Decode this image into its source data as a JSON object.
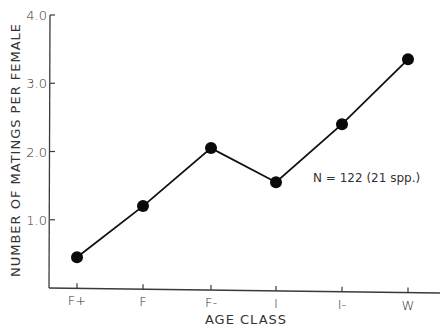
{
  "chart_data": {
    "type": "line",
    "title": "",
    "xlabel": "AGE CLASS",
    "ylabel": "NUMBER OF MATINGS PER FEMALE",
    "categories": [
      "F+",
      "F",
      "F-",
      "I",
      "I-",
      "W"
    ],
    "x_tick_labels": [
      "F+",
      "F",
      "F-",
      "I",
      "I-",
      "W"
    ],
    "series": [
      {
        "name": "Matings per female",
        "values": [
          0.45,
          1.2,
          2.05,
          1.55,
          2.4,
          3.35
        ],
        "marker": "filled-circle",
        "color": "#111111"
      }
    ],
    "ylim": [
      0,
      4.0
    ],
    "y_ticks": [
      1.0,
      2.0,
      3.0,
      4.0
    ],
    "y_tick_labels": [
      "1.0",
      "2.0",
      "3.0",
      "4.0"
    ],
    "grid": false,
    "legend": null,
    "annotations": [
      {
        "text": "N = 122 (21 spp.)",
        "x_category": "I",
        "y_value": 1.65
      }
    ]
  },
  "labels": {
    "xlabel": "AGE CLASS",
    "ylabel": "NUMBER OF MATINGS PER FEMALE",
    "annotation": "N = 122 (21 spp.)"
  },
  "colors": {
    "axis": "#3a3a3a",
    "line": "#111111",
    "marker": "#0a0a0a",
    "text": "#333333",
    "background": "#ffffff"
  }
}
